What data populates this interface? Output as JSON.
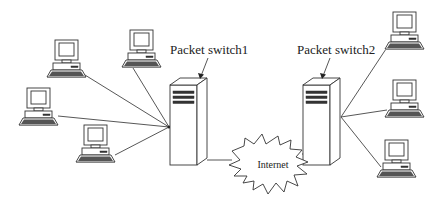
{
  "diagram": {
    "type": "network-topology",
    "switches": [
      {
        "id": "switch1",
        "label": "Packet switch1",
        "x": 170,
        "y": 85,
        "hub": [
          169,
          127
        ],
        "label_pos": [
          170,
          53
        ]
      },
      {
        "id": "switch2",
        "label": "Packet switch2",
        "x": 302,
        "y": 85,
        "hub": [
          341,
          117
        ],
        "label_pos": [
          297,
          53
        ]
      }
    ],
    "cloud": {
      "label": "Internet",
      "cx": 273,
      "cy": 165
    },
    "computers": [
      {
        "id": "pc-a",
        "x": 55,
        "y": 40,
        "connects_to": "switch1",
        "port": [
          85,
          75
        ]
      },
      {
        "id": "pc-b",
        "x": 130,
        "y": 30,
        "connects_to": "switch1",
        "port": [
          133,
          68
        ]
      },
      {
        "id": "pc-c",
        "x": 27,
        "y": 88,
        "connects_to": "switch1",
        "port": [
          58,
          116
        ]
      },
      {
        "id": "pc-d",
        "x": 84,
        "y": 125,
        "connects_to": "switch1",
        "port": [
          115,
          155
        ]
      },
      {
        "id": "pc-e",
        "x": 393,
        "y": 12,
        "connects_to": "switch2",
        "port": [
          386,
          49
        ]
      },
      {
        "id": "pc-f",
        "x": 393,
        "y": 80,
        "connects_to": "switch2",
        "port": [
          387,
          110
        ]
      },
      {
        "id": "pc-g",
        "x": 385,
        "y": 140,
        "connects_to": "switch2",
        "port": [
          381,
          167
        ]
      }
    ]
  },
  "colors": {
    "line": "#444444",
    "background": "#ffffff"
  }
}
